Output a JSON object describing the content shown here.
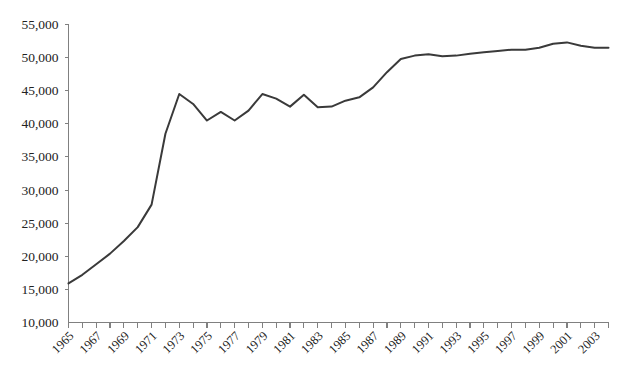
{
  "chart_data": {
    "type": "line",
    "title": "",
    "subtitle": "",
    "xlabel": "",
    "ylabel": "",
    "grid": false,
    "legend": "none",
    "line_color": "#3a3a3a",
    "axis_color": "#808080",
    "xlim": [
      1965,
      2004
    ],
    "ylim": [
      10000,
      55000
    ],
    "y_ticks": [
      10000,
      15000,
      20000,
      25000,
      30000,
      35000,
      40000,
      45000,
      50000,
      55000
    ],
    "y_tick_labels": [
      "10,000",
      "15,000",
      "20,000",
      "25,000",
      "30,000",
      "35,000",
      "40,000",
      "45,000",
      "50,000",
      "55,000"
    ],
    "x_ticks": [
      1965,
      1966,
      1967,
      1968,
      1969,
      1970,
      1971,
      1972,
      1973,
      1974,
      1975,
      1976,
      1977,
      1978,
      1979,
      1980,
      1981,
      1982,
      1983,
      1984,
      1985,
      1986,
      1987,
      1988,
      1989,
      1990,
      1991,
      1992,
      1993,
      1994,
      1995,
      1996,
      1997,
      1998,
      1999,
      2000,
      2001,
      2002,
      2003,
      2004
    ],
    "x_tick_labels": [
      "1965",
      "1967",
      "1969",
      "1971",
      "1973",
      "1975",
      "1977",
      "1979",
      "1981",
      "1983",
      "1985",
      "1987",
      "1989",
      "1991",
      "1993",
      "1995",
      "1997",
      "1999",
      "2001",
      "2003"
    ],
    "x_tick_label_years": [
      1965,
      1967,
      1969,
      1971,
      1973,
      1975,
      1977,
      1979,
      1981,
      1983,
      1985,
      1987,
      1989,
      1991,
      1993,
      1995,
      1997,
      1999,
      2001,
      2003
    ],
    "x_label_rotation_deg": -45,
    "series": [
      {
        "name": "value",
        "x": [
          1965,
          1966,
          1967,
          1968,
          1969,
          1970,
          1971,
          1972,
          1973,
          1974,
          1975,
          1976,
          1977,
          1978,
          1979,
          1980,
          1981,
          1982,
          1983,
          1984,
          1985,
          1986,
          1987,
          1988,
          1989,
          1990,
          1991,
          1992,
          1993,
          1994,
          1995,
          1996,
          1997,
          1998,
          1999,
          2000,
          2001,
          2002,
          2003,
          2004
        ],
        "values": [
          15900,
          17200,
          18800,
          20400,
          22300,
          24400,
          27800,
          38500,
          44500,
          43000,
          40500,
          41800,
          40500,
          42000,
          44500,
          43800,
          42600,
          44400,
          42500,
          42600,
          43500,
          44000,
          45500,
          47800,
          49800,
          50300,
          50500,
          50200,
          50300,
          50600,
          50800,
          51000,
          51200,
          51200,
          51500,
          52100,
          52300,
          51800,
          51500,
          51500
        ]
      }
    ]
  }
}
